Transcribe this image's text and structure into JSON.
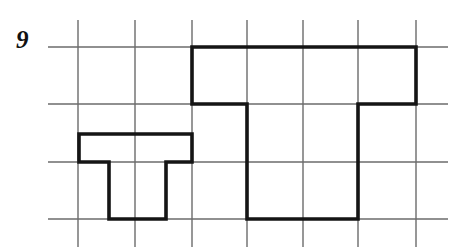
{
  "page": {
    "width": 461,
    "height": 247,
    "background_color": "#ffffff",
    "kind": "grid-paper-geometry-exercise"
  },
  "exercise": {
    "number_label": "9"
  },
  "grid": {
    "line_color": "#6b6b6b",
    "line_width": 1.4,
    "cell_width": 56.5,
    "cell_height": 57.5,
    "vertical_lines_x": [
      78,
      135,
      192,
      247,
      303,
      358,
      416
    ],
    "vertical_span_y": [
      20,
      247
    ],
    "horizontal_lines_y": [
      47,
      104,
      162,
      219
    ],
    "horizontal_span_x": [
      48,
      448
    ]
  },
  "figures": {
    "stroke_color": "#151515",
    "stroke_width": 3.6,
    "shapes": [
      {
        "name": "pi-shape-left",
        "description": "Small pi / table shaped polygon on the lower left of the grid",
        "closed": true,
        "points": [
          [
            79,
            134
          ],
          [
            192,
            134
          ],
          [
            192,
            162
          ],
          [
            166,
            162
          ],
          [
            166,
            219
          ],
          [
            109,
            219
          ],
          [
            109,
            162
          ],
          [
            79,
            162
          ]
        ],
        "path": "M 79 134 L 192 134 L 192 162 L 166 162 L 166 219 L 109 219 L 109 162 L 79 162 Z"
      },
      {
        "name": "staircase-shape-right",
        "description": "Large stepped polygon occupying the right portion of the grid",
        "closed": true,
        "points": [
          [
            192,
            47
          ],
          [
            416,
            47
          ],
          [
            416,
            104
          ],
          [
            358,
            104
          ],
          [
            358,
            219
          ],
          [
            247,
            219
          ],
          [
            247,
            104
          ],
          [
            192,
            104
          ]
        ],
        "path": "M 192 47 L 416 47 L 416 104 L 358 104 L 358 219 L 247 219 L 247 104 L 192 104 Z"
      }
    ]
  }
}
